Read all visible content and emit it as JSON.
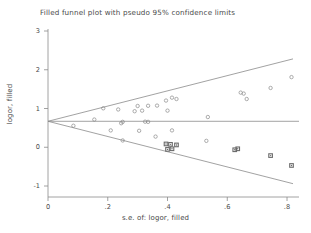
{
  "chart_data": {
    "type": "scatter",
    "title": "Filled funnel plot with pseudo 95% confidence limits",
    "xlabel": "s.e. of: logor, filled",
    "ylabel": "logor, filled",
    "xlim": [
      -0.02,
      0.86
    ],
    "ylim": [
      -1.25,
      3.3
    ],
    "xticks": [
      0,
      0.2,
      0.4,
      0.6,
      0.8
    ],
    "xtick_labels": [
      "0",
      ".2",
      ".4",
      ".6",
      ".8"
    ],
    "yticks": [
      -1,
      0,
      1,
      2,
      3
    ],
    "ytick_labels": [
      "-1",
      "0",
      "1",
      "2",
      "3"
    ],
    "grid": false,
    "legend": null,
    "pooled_effect": 0.67,
    "reference_line": {
      "label": "pooled logor",
      "value": 0.67,
      "color": "#8a8a8a"
    },
    "confidence_limits": {
      "label": "pseudo 95% confidence limits",
      "color": "#8a8a8a",
      "upper": [
        [
          0,
          0.67
        ],
        [
          0.82,
          2.28
        ]
      ],
      "lower": [
        [
          0,
          0.67
        ],
        [
          0.82,
          -0.94
        ]
      ]
    },
    "series": [
      {
        "name": "observed studies",
        "marker": "open-circle",
        "color": "#8a8a8a",
        "points": [
          [
            0.155,
            0.715
          ],
          [
            0.185,
            1.005
          ],
          [
            0.21,
            0.435
          ],
          [
            0.235,
            0.975
          ],
          [
            0.245,
            0.62
          ],
          [
            0.25,
            0.655
          ],
          [
            0.25,
            0.175
          ],
          [
            0.29,
            0.93
          ],
          [
            0.3,
            1.065
          ],
          [
            0.305,
            0.425
          ],
          [
            0.315,
            0.945
          ],
          [
            0.325,
            0.66
          ],
          [
            0.335,
            0.655
          ],
          [
            0.335,
            1.07
          ],
          [
            0.36,
            0.275
          ],
          [
            0.365,
            1.075
          ],
          [
            0.395,
            1.205
          ],
          [
            0.4,
            0.945
          ],
          [
            0.415,
            0.435
          ],
          [
            0.415,
            1.28
          ],
          [
            0.43,
            1.245
          ],
          [
            0.535,
            0.78
          ],
          [
            0.53,
            0.165
          ],
          [
            0.645,
            1.41
          ],
          [
            0.655,
            1.385
          ],
          [
            0.665,
            1.245
          ],
          [
            0.745,
            1.53
          ],
          [
            0.815,
            1.81
          ],
          [
            0.085,
            0.555
          ]
        ]
      },
      {
        "name": "filled (imputed) studies",
        "marker": "filled-square",
        "color": "#6b6b6b",
        "points": [
          [
            0.395,
            0.085
          ],
          [
            0.41,
            0.075
          ],
          [
            0.415,
            -0.04
          ],
          [
            0.43,
            0.06
          ],
          [
            0.4,
            -0.055
          ],
          [
            0.625,
            -0.065
          ],
          [
            0.635,
            -0.04
          ],
          [
            0.745,
            -0.215
          ],
          [
            0.815,
            -0.47
          ]
        ]
      }
    ]
  },
  "axes": {
    "title_text": "Filled funnel plot with pseudo 95% confidence limits",
    "x_axis_label": "s.e. of: logor, filled",
    "y_axis_label": "logor, filled"
  },
  "colors": {
    "axis": "#8a8a8a",
    "text": "#4a4a4a",
    "marker_open": "#8a8a8a",
    "marker_filled": "#6b6b6b",
    "background": "#ffffff"
  }
}
